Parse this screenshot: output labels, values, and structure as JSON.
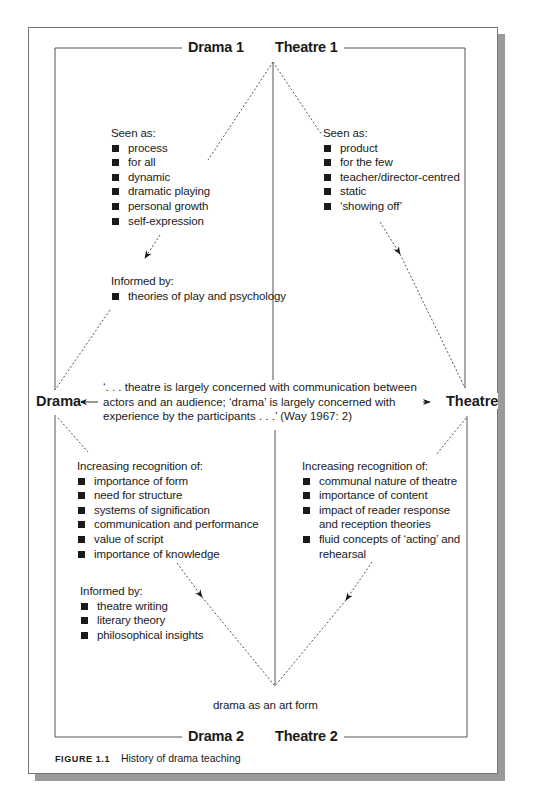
{
  "diagram": {
    "corners": {
      "top_left": "Drama 1",
      "top_right": "Theatre 1",
      "bottom_left": "Drama 2",
      "bottom_right": "Theatre 2"
    },
    "sides": {
      "left": "Drama",
      "right": "Theatre"
    },
    "drama1": {
      "seen_as_heading": "Seen as:",
      "seen_as": [
        "process",
        "for all",
        "dynamic",
        "dramatic playing",
        "personal growth",
        "self-expression"
      ],
      "informed_by_heading": "Informed by:",
      "informed_by": [
        "theories of play and psychology"
      ]
    },
    "theatre1": {
      "seen_as_heading": "Seen as:",
      "seen_as": [
        "product",
        "for the few",
        "teacher/director-centred",
        "static",
        "‘showing off’"
      ]
    },
    "quote": {
      "line1": "‘. . . theatre is largely concerned with communication between",
      "line2": "actors and an audience; ‘drama’ is largely concerned with",
      "line3": "experience by the participants . . .’ (Way 1967: 2)"
    },
    "drama2": {
      "recognition_heading": "Increasing recognition of:",
      "recognition": [
        "importance of form",
        "need for structure",
        "systems of signification",
        "communication and performance",
        "value of script",
        "importance of knowledge"
      ],
      "informed_by_heading": "Informed by:",
      "informed_by": [
        "theatre writing",
        "literary theory",
        "philosophical insights"
      ]
    },
    "theatre2": {
      "recognition_heading": "Increasing recognition of:",
      "recognition": [
        "communal nature of theatre",
        "importance of content",
        "impact of reader response and reception theories",
        "fluid concepts of ‘acting’ and rehearsal"
      ]
    },
    "bottom_label": "drama as an art form"
  },
  "caption": {
    "label": "FIGURE 1.1",
    "text": "History of drama teaching"
  },
  "colors": {
    "line": "#555555",
    "text": "#1a1a1a",
    "shadow": "#9a9a9a"
  }
}
